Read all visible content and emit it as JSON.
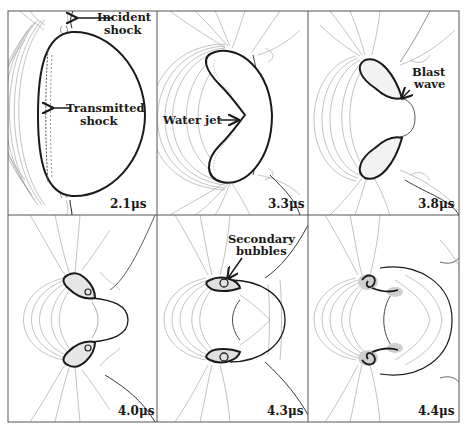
{
  "figure": {
    "layout": {
      "rows": 2,
      "cols": 3
    },
    "colors": {
      "background": "#ffffff",
      "bubble_outline": "#1a1a1a",
      "contour": "#8a8a8a",
      "frame": "#555555",
      "text": "#1a1a1a"
    },
    "panels": [
      {
        "time": "2.1μs",
        "annotations": [
          {
            "text_lines": [
              "Incident",
              "shock"
            ]
          },
          {
            "text_lines": [
              "Transmitted",
              "shock"
            ]
          }
        ]
      },
      {
        "time": "3.3μs",
        "annotations": [
          {
            "text_lines": [
              "Water jet"
            ]
          }
        ]
      },
      {
        "time": "3.8μs",
        "annotations": [
          {
            "text_lines": [
              "Blast",
              "wave"
            ]
          }
        ]
      },
      {
        "time": "4.0μs",
        "annotations": []
      },
      {
        "time": "4.3μs",
        "annotations": [
          {
            "text_lines": [
              "Secondary",
              "bubbles"
            ]
          }
        ]
      },
      {
        "time": "4.4μs",
        "annotations": []
      }
    ]
  }
}
